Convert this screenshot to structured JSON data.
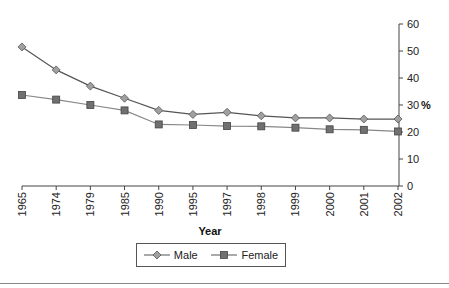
{
  "chart_data": {
    "type": "line",
    "title": "",
    "xlabel": "Year",
    "ylabel": "%",
    "x": [
      "1965",
      "1974",
      "1979",
      "1985",
      "1990",
      "1995",
      "1997",
      "1998",
      "1999",
      "2000",
      "2001",
      "2002"
    ],
    "series": [
      {
        "name": "Male",
        "marker": "diamond",
        "color": "#a0a0a0",
        "line_color": "#555555",
        "values": [
          51.5,
          43,
          37,
          32.5,
          28,
          26.5,
          27.3,
          26,
          25.2,
          25.2,
          24.8,
          24.8
        ]
      },
      {
        "name": "Female",
        "marker": "square",
        "color": "#707070",
        "line_color": "#888888",
        "values": [
          33.7,
          32,
          30,
          28,
          22.8,
          22.6,
          22.2,
          22.1,
          21.6,
          21,
          20.8,
          20.2
        ]
      }
    ],
    "ylim": [
      0,
      60
    ],
    "yticks": [
      0,
      10,
      20,
      30,
      40,
      50,
      60
    ],
    "y_axis_position": "right",
    "grid": false,
    "legend_position": "bottom"
  },
  "legend": {
    "male_label": "Male",
    "female_label": "Female"
  },
  "axis": {
    "x_title": "Year",
    "y_title": "%"
  }
}
